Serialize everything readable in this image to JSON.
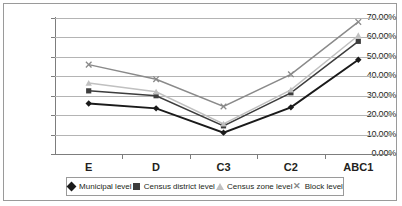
{
  "chart_data": {
    "type": "line",
    "title": "",
    "subtitle": "",
    "xlabel": "",
    "ylabel": "",
    "categories": [
      "E",
      "D",
      "C3",
      "C2",
      "ABC1"
    ],
    "ylim": [
      0,
      70
    ],
    "ytick_labels": [
      "70.00%",
      "60.00%",
      "50.00%",
      "40.00%",
      "30.00%",
      "20.00%",
      "10.00%",
      "0.00%"
    ],
    "ytick_values": [
      70,
      60,
      50,
      40,
      30,
      20,
      10,
      0
    ],
    "grid": true,
    "legend_position": "bottom",
    "series": [
      {
        "name": "Municipal level",
        "marker": "diamond",
        "color": "#1a1a1a",
        "values": [
          26.0,
          23.5,
          11.0,
          24.0,
          48.5
        ]
      },
      {
        "name": "Census district level",
        "marker": "square",
        "color": "#3d3d3d",
        "values": [
          32.5,
          30.0,
          14.5,
          31.5,
          58.0
        ]
      },
      {
        "name": "Census zone level",
        "marker": "triangle",
        "color": "#c0c0c0",
        "values": [
          36.5,
          32.0,
          15.5,
          33.0,
          61.0
        ]
      },
      {
        "name": "Block level",
        "marker": "x",
        "color": "#8a8a8a",
        "values": [
          46.0,
          38.5,
          24.5,
          41.0,
          68.0
        ]
      }
    ]
  },
  "legend": {
    "entries": [
      {
        "label": "Municipal level"
      },
      {
        "label": "Census district level"
      },
      {
        "label": "Census zone level"
      },
      {
        "label": "Block level"
      }
    ]
  },
  "colors": {
    "frame_border": "#9a9a9a",
    "gridline": "#b4b4b4",
    "axis": "#7d7d7d",
    "text": "#231f20",
    "background": "#ffffff"
  }
}
